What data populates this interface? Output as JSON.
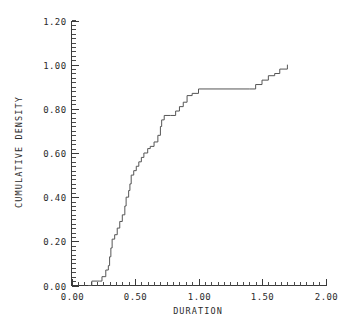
{
  "chart_data": {
    "type": "line",
    "subtype": "step-ecdf",
    "title": "",
    "xlabel": "DURATION",
    "ylabel": "CUMULATIVE DENSITY",
    "xlim": [
      0.0,
      2.0
    ],
    "ylim": [
      0.0,
      1.2
    ],
    "grid": false,
    "legend": null,
    "x_major_ticks": [
      0.0,
      0.5,
      1.0,
      1.5,
      2.0
    ],
    "x_major_tick_labels": [
      "0.00",
      "0.50",
      "1.00",
      "1.50",
      "2.00"
    ],
    "x_minor_tick_step": 0.05,
    "y_major_ticks": [
      0.0,
      0.2,
      0.4,
      0.6,
      0.8,
      1.0,
      1.2
    ],
    "y_major_tick_labels": [
      "0.00",
      "0.20",
      "0.40",
      "0.60",
      "0.80",
      "1.00",
      "1.20"
    ],
    "y_minor_tick_step": 0.02,
    "line_color": "#555555",
    "axis_color": "#3a3a3a",
    "background_color": "#ffffff",
    "series": [
      {
        "name": "empirical cumulative density",
        "x": [
          0.13,
          0.16,
          0.22,
          0.24,
          0.27,
          0.29,
          0.3,
          0.31,
          0.32,
          0.34,
          0.36,
          0.38,
          0.4,
          0.42,
          0.43,
          0.45,
          0.46,
          0.47,
          0.49,
          0.51,
          0.53,
          0.55,
          0.57,
          0.6,
          0.62,
          0.65,
          0.68,
          0.7,
          0.71,
          0.73,
          0.78,
          0.82,
          0.85,
          0.88,
          0.91,
          0.95,
          1.0,
          1.4,
          1.45,
          1.5,
          1.55,
          1.6,
          1.64,
          1.7
        ],
        "y": [
          0.0,
          0.02,
          0.02,
          0.04,
          0.07,
          0.09,
          0.13,
          0.17,
          0.21,
          0.23,
          0.26,
          0.29,
          0.32,
          0.36,
          0.4,
          0.43,
          0.46,
          0.5,
          0.52,
          0.54,
          0.56,
          0.58,
          0.6,
          0.62,
          0.63,
          0.65,
          0.68,
          0.72,
          0.75,
          0.77,
          0.77,
          0.79,
          0.81,
          0.83,
          0.86,
          0.87,
          0.89,
          0.89,
          0.91,
          0.93,
          0.95,
          0.96,
          0.98,
          1.0
        ],
        "step_mode": "post",
        "start_point": {
          "x": 0.13,
          "y": 0.0
        },
        "end_point": {
          "x": 1.7,
          "y": 1.0
        },
        "plateau": {
          "from_x": 1.0,
          "to_x": 1.4,
          "at_y": 0.89
        }
      }
    ]
  },
  "axes": {
    "x_title": "DURATION",
    "y_title": "CUMULATIVE DENSITY"
  }
}
